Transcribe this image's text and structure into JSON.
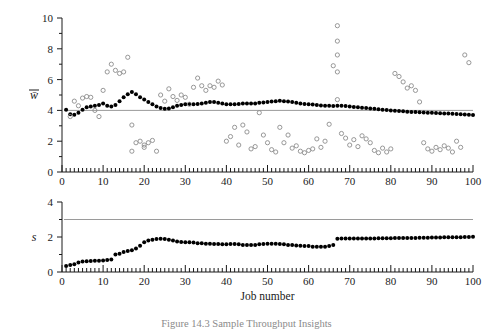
{
  "figure": {
    "caption": "Figure 14.3   Sample   Throughput Insights",
    "xlabel": "Job number"
  },
  "chart_data": [
    {
      "type": "scatter",
      "panel": "top",
      "title": "",
      "xlabel": "",
      "ylabel": "w̄",
      "ylabel_plain": "w-bar",
      "xlim": [
        0,
        100
      ],
      "ylim": [
        0,
        10
      ],
      "xticks": [
        0,
        10,
        20,
        30,
        40,
        50,
        60,
        70,
        80,
        90,
        100
      ],
      "yticks": [
        0,
        2,
        4,
        6,
        8,
        10
      ],
      "minor_xtick_step": 1,
      "minor_ytick_step": 1,
      "grid": false,
      "legend": "none",
      "reference_line": {
        "y": 4,
        "color": "#9a9a9a",
        "label": ""
      },
      "series": [
        {
          "name": "mean waiting time (filled)",
          "marker": "filled-circle",
          "color": "#000000",
          "x": [
            1,
            2,
            3,
            4,
            5,
            6,
            7,
            8,
            9,
            10,
            11,
            12,
            13,
            14,
            15,
            16,
            17,
            18,
            19,
            20,
            21,
            22,
            23,
            24,
            25,
            26,
            27,
            28,
            29,
            30,
            31,
            32,
            33,
            34,
            35,
            36,
            37,
            38,
            39,
            40,
            41,
            42,
            43,
            44,
            45,
            46,
            47,
            48,
            49,
            50,
            51,
            52,
            53,
            54,
            55,
            56,
            57,
            58,
            59,
            60,
            61,
            62,
            63,
            64,
            65,
            66,
            67,
            68,
            69,
            70,
            71,
            72,
            73,
            74,
            75,
            76,
            77,
            78,
            79,
            80,
            81,
            82,
            83,
            84,
            85,
            86,
            87,
            88,
            89,
            90,
            91,
            92,
            93,
            94,
            95,
            96,
            97,
            98,
            99,
            100
          ],
          "y": [
            4.05,
            3.75,
            3.72,
            3.85,
            4.05,
            4.2,
            4.25,
            4.3,
            4.35,
            4.45,
            4.3,
            4.25,
            4.35,
            4.6,
            4.85,
            5.05,
            5.2,
            5.05,
            4.85,
            4.7,
            4.55,
            4.4,
            4.25,
            4.15,
            4.1,
            4.12,
            4.2,
            4.3,
            4.35,
            4.4,
            4.42,
            4.4,
            4.42,
            4.45,
            4.5,
            4.55,
            4.55,
            4.5,
            4.45,
            4.4,
            4.4,
            4.4,
            4.42,
            4.45,
            4.45,
            4.45,
            4.45,
            4.5,
            4.52,
            4.55,
            4.58,
            4.6,
            4.62,
            4.6,
            4.58,
            4.55,
            4.5,
            4.45,
            4.42,
            4.4,
            4.38,
            4.35,
            4.32,
            4.3,
            4.3,
            4.28,
            4.3,
            4.3,
            4.28,
            4.25,
            4.22,
            4.2,
            4.18,
            4.15,
            4.12,
            4.1,
            4.08,
            4.05,
            4.02,
            4.0,
            3.98,
            3.96,
            3.94,
            3.92,
            3.9,
            3.9,
            3.88,
            3.86,
            3.85,
            3.85,
            3.83,
            3.82,
            3.8,
            3.8,
            3.78,
            3.76,
            3.75,
            3.74,
            3.72,
            3.7
          ]
        },
        {
          "name": "individual waiting times (open)",
          "marker": "open-circle",
          "color": "#8c8c8c",
          "x": [
            2,
            3,
            4,
            5,
            6,
            7,
            8,
            9,
            10,
            11,
            12,
            13,
            14,
            15,
            16,
            17,
            17,
            18,
            19,
            20,
            20,
            21,
            22,
            23,
            24,
            25,
            26,
            27,
            28,
            29,
            30,
            31,
            32,
            33,
            34,
            35,
            36,
            37,
            38,
            39,
            40,
            41,
            42,
            43,
            44,
            45,
            46,
            47,
            48,
            49,
            50,
            51,
            52,
            53,
            54,
            55,
            56,
            57,
            58,
            59,
            60,
            61,
            62,
            63,
            64,
            65,
            66,
            67,
            67,
            67,
            67,
            67,
            68,
            69,
            70,
            71,
            72,
            73,
            74,
            75,
            76,
            77,
            78,
            79,
            80,
            81,
            82,
            83,
            84,
            85,
            86,
            87,
            88,
            89,
            90,
            91,
            92,
            93,
            94,
            95,
            96,
            97,
            98,
            99
          ],
          "y": [
            3.6,
            4.6,
            4.3,
            4.8,
            4.9,
            4.85,
            4.0,
            3.6,
            5.3,
            6.5,
            7.0,
            6.6,
            6.4,
            6.5,
            7.45,
            3.05,
            1.35,
            1.9,
            2.0,
            1.6,
            1.75,
            1.9,
            2.05,
            1.35,
            5.0,
            4.6,
            5.4,
            4.9,
            4.65,
            5.0,
            4.85,
            4.4,
            5.5,
            6.1,
            5.6,
            5.3,
            5.6,
            5.5,
            5.9,
            5.65,
            2.0,
            2.3,
            2.9,
            1.75,
            3.05,
            2.6,
            1.5,
            1.65,
            3.85,
            2.4,
            1.9,
            1.45,
            1.3,
            2.9,
            1.9,
            2.4,
            1.55,
            1.7,
            1.35,
            1.25,
            1.4,
            1.5,
            2.15,
            1.6,
            2.0,
            3.1,
            6.9,
            9.5,
            8.5,
            7.6,
            6.5,
            4.7,
            2.5,
            2.2,
            1.75,
            2.1,
            1.65,
            2.35,
            2.15,
            1.9,
            1.4,
            1.25,
            1.55,
            1.3,
            1.5,
            6.4,
            6.2,
            5.85,
            5.45,
            5.6,
            5.3,
            4.55,
            1.9,
            1.5,
            1.35,
            1.6,
            1.45,
            1.7,
            1.55,
            1.3,
            2.0,
            1.6,
            7.6,
            7.1
          ]
        }
      ]
    },
    {
      "type": "scatter",
      "panel": "bottom",
      "title": "",
      "xlabel": "Job number",
      "ylabel": "s",
      "xlim": [
        0,
        100
      ],
      "ylim": [
        0,
        4
      ],
      "xticks": [
        0,
        10,
        20,
        30,
        40,
        50,
        60,
        70,
        80,
        90,
        100
      ],
      "yticks": [
        0,
        2,
        4
      ],
      "minor_xtick_step": 1,
      "minor_ytick_step": 1,
      "grid": false,
      "legend": "none",
      "reference_line": {
        "y": 3,
        "color": "#9a9a9a",
        "label": ""
      },
      "series": [
        {
          "name": "service time (filled)",
          "marker": "filled-circle",
          "color": "#000000",
          "x": [
            1,
            2,
            3,
            4,
            5,
            6,
            7,
            8,
            9,
            10,
            11,
            12,
            13,
            14,
            15,
            16,
            17,
            18,
            19,
            20,
            21,
            22,
            23,
            24,
            25,
            26,
            27,
            28,
            29,
            30,
            31,
            32,
            33,
            34,
            35,
            36,
            37,
            38,
            39,
            40,
            41,
            42,
            43,
            44,
            45,
            46,
            47,
            48,
            49,
            50,
            51,
            52,
            53,
            54,
            55,
            56,
            57,
            58,
            59,
            60,
            61,
            62,
            63,
            64,
            65,
            66,
            67,
            68,
            69,
            70,
            71,
            72,
            73,
            74,
            75,
            76,
            77,
            78,
            79,
            80,
            81,
            82,
            83,
            84,
            85,
            86,
            87,
            88,
            89,
            90,
            91,
            92,
            93,
            94,
            95,
            96,
            97,
            98,
            99,
            100
          ],
          "y": [
            0.35,
            0.4,
            0.45,
            0.55,
            0.6,
            0.62,
            0.63,
            0.64,
            0.65,
            0.66,
            0.68,
            0.72,
            1.0,
            1.05,
            1.15,
            1.2,
            1.25,
            1.35,
            1.5,
            1.7,
            1.8,
            1.85,
            1.88,
            1.9,
            1.88,
            1.85,
            1.8,
            1.75,
            1.72,
            1.7,
            1.7,
            1.68,
            1.65,
            1.65,
            1.62,
            1.62,
            1.6,
            1.6,
            1.58,
            1.58,
            1.6,
            1.6,
            1.58,
            1.55,
            1.55,
            1.55,
            1.55,
            1.58,
            1.6,
            1.62,
            1.62,
            1.62,
            1.6,
            1.58,
            1.55,
            1.55,
            1.52,
            1.5,
            1.48,
            1.48,
            1.45,
            1.45,
            1.45,
            1.45,
            1.48,
            1.55,
            1.9,
            1.92,
            1.92,
            1.92,
            1.92,
            1.92,
            1.92,
            1.92,
            1.92,
            1.92,
            1.93,
            1.93,
            1.93,
            1.93,
            1.94,
            1.94,
            1.94,
            1.95,
            1.95,
            1.95,
            1.96,
            1.96,
            1.96,
            1.97,
            1.97,
            1.97,
            1.98,
            1.98,
            1.98,
            1.99,
            1.99,
            2.0,
            2.0,
            2.02
          ]
        }
      ]
    }
  ]
}
